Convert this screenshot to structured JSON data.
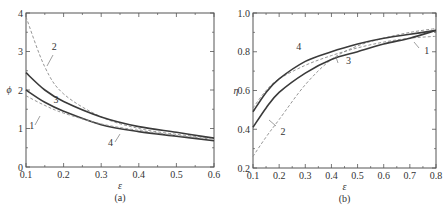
{
  "chart_data": [
    {
      "type": "line",
      "panel_label": "(a)",
      "xlabel": "ε",
      "ylabel": "ϕ",
      "xlim": [
        0.1,
        0.6
      ],
      "ylim": [
        0,
        4
      ],
      "xticks": [
        "0.1",
        "0.2",
        "0.3",
        "0.4",
        "0.5",
        "0.6"
      ],
      "yticks": [
        "0",
        "1",
        "2",
        "3",
        "4"
      ],
      "grid": false,
      "x": [
        0.1,
        0.15,
        0.2,
        0.3,
        0.4,
        0.5,
        0.6
      ],
      "series": [
        {
          "name": "1",
          "style": "solid",
          "values": [
            2.0,
            1.68,
            1.45,
            1.1,
            0.92,
            0.8,
            0.68
          ]
        },
        {
          "name": "2",
          "style": "dashed",
          "values": [
            3.9,
            2.6,
            1.9,
            1.3,
            1.0,
            0.85,
            0.75
          ]
        },
        {
          "name": "3",
          "style": "solid",
          "values": [
            2.45,
            2.0,
            1.7,
            1.3,
            1.05,
            0.9,
            0.75
          ]
        },
        {
          "name": "4",
          "style": "dashed",
          "values": [
            1.85,
            1.6,
            1.4,
            1.12,
            0.95,
            0.82,
            0.72
          ]
        }
      ],
      "annotations": [
        {
          "text": "1",
          "x": 0.115,
          "y": 1.0
        },
        {
          "text": "2",
          "x": 0.175,
          "y": 3.05
        },
        {
          "text": "3",
          "x": 0.18,
          "y": 1.65
        },
        {
          "text": "4",
          "x": 0.325,
          "y": 0.55
        }
      ]
    },
    {
      "type": "line",
      "panel_label": "(b)",
      "xlabel": "ε",
      "ylabel": "η",
      "xlim": [
        0.1,
        0.8
      ],
      "ylim": [
        0.2,
        1.0
      ],
      "xticks": [
        "0.1",
        "0.2",
        "0.3",
        "0.4",
        "0.5",
        "0.6",
        "0.7",
        "0.8"
      ],
      "yticks": [
        "0.2",
        "0.4",
        "0.6",
        "0.8",
        "1.0"
      ],
      "grid": false,
      "x": [
        0.1,
        0.15,
        0.2,
        0.3,
        0.4,
        0.5,
        0.6,
        0.7,
        0.8
      ],
      "series": [
        {
          "name": "1",
          "style": "dashed",
          "values": [
            0.51,
            0.6,
            0.66,
            0.73,
            0.78,
            0.82,
            0.85,
            0.87,
            0.88
          ]
        },
        {
          "name": "2",
          "style": "dashed",
          "values": [
            0.26,
            0.36,
            0.45,
            0.63,
            0.76,
            0.83,
            0.87,
            0.9,
            0.92
          ]
        },
        {
          "name": "3",
          "style": "solid",
          "values": [
            0.41,
            0.51,
            0.59,
            0.69,
            0.76,
            0.8,
            0.84,
            0.87,
            0.91
          ]
        },
        {
          "name": "4",
          "style": "solid",
          "values": [
            0.49,
            0.59,
            0.66,
            0.75,
            0.8,
            0.84,
            0.87,
            0.89,
            0.91
          ]
        }
      ],
      "annotations": [
        {
          "text": "1",
          "x": 0.765,
          "y": 0.79
        },
        {
          "text": "2",
          "x": 0.215,
          "y": 0.37
        },
        {
          "text": "3",
          "x": 0.465,
          "y": 0.735
        },
        {
          "text": "4",
          "x": 0.275,
          "y": 0.81
        }
      ]
    }
  ]
}
